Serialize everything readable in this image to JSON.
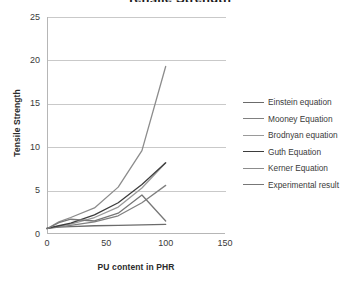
{
  "chart_data": {
    "type": "line",
    "title": "",
    "xlabel": "PU content in PHR",
    "ylabel": "Tensile Strength",
    "xlim": [
      0,
      150
    ],
    "ylim": [
      0,
      25
    ],
    "xticks": [
      0,
      50,
      100,
      150
    ],
    "yticks": [
      0,
      5,
      10,
      15,
      20,
      25
    ],
    "grid": "horizontal",
    "legend_position": "right",
    "x": [
      0,
      10,
      20,
      40,
      60,
      80,
      100
    ],
    "series": [
      {
        "name": "Einstein equation",
        "color": "#6b6b6b",
        "values": [
          0.65,
          0.8,
          0.85,
          0.95,
          1.0,
          1.05,
          1.1
        ]
      },
      {
        "name": "Mooney Equation",
        "color": "#808080",
        "values": [
          0.65,
          0.85,
          1.0,
          1.4,
          2.1,
          3.6,
          5.6
        ]
      },
      {
        "name": "Brodnyan equation",
        "color": "#9a9a9a",
        "values": [
          0.65,
          0.9,
          1.15,
          1.9,
          3.1,
          5.3,
          8.2
        ]
      },
      {
        "name": "Guth Equation",
        "color": "#3d3d3d",
        "values": [
          0.65,
          0.95,
          1.25,
          2.2,
          3.6,
          5.7,
          8.2
        ]
      },
      {
        "name": "Kerner Equation",
        "color": "#8c8c8c",
        "values": [
          0.6,
          1.4,
          1.9,
          3.0,
          5.4,
          9.6,
          19.3
        ]
      },
      {
        "name": "Experimental result",
        "color": "#777777",
        "values": [
          0.6,
          1.3,
          1.7,
          1.5,
          2.4,
          4.5,
          1.5
        ]
      }
    ]
  },
  "axes": {
    "x_title": "PU content in PHR",
    "y_title": "Tensile Strength",
    "x_tick_labels": [
      "0",
      "50",
      "100",
      "150"
    ],
    "y_tick_labels": [
      "0",
      "5",
      "10",
      "15",
      "20",
      "25"
    ]
  },
  "legend": {
    "entries": [
      {
        "label": "Einstein equation"
      },
      {
        "label": "Mooney Equation"
      },
      {
        "label": "Brodnyan equation"
      },
      {
        "label": "Guth Equation"
      },
      {
        "label": "Kerner Equation"
      },
      {
        "label": "Experimental result"
      }
    ]
  },
  "title_fragment": "Tensile Strength"
}
